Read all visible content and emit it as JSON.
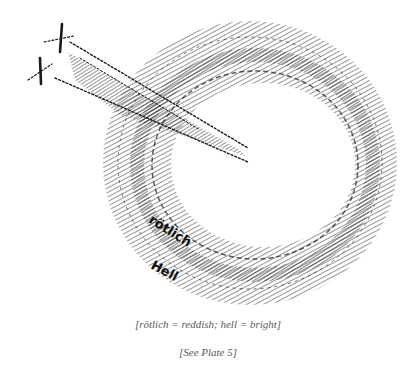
{
  "figure": {
    "labels": {
      "reddish": "rötlich",
      "bright": "Hell"
    },
    "ink_color": "#1a1a1a",
    "background": "#ffffff"
  },
  "captions": {
    "translation": "[rötlich = reddish; hell = bright]",
    "plate_ref": "[See Plate 5]"
  }
}
